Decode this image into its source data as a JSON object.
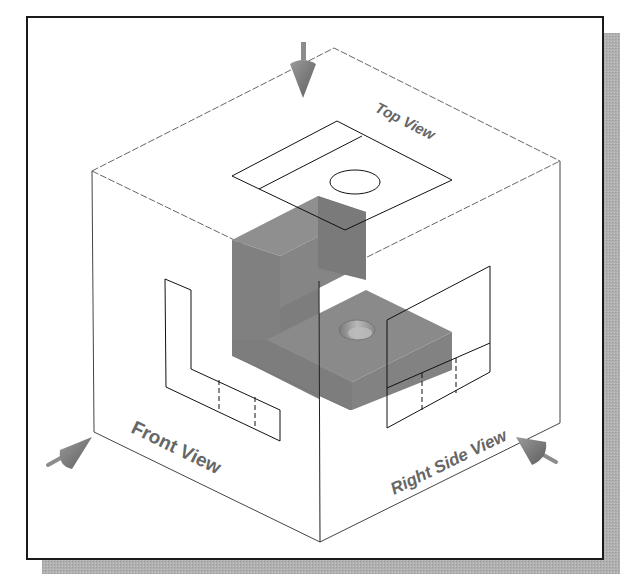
{
  "figure": {
    "type": "orthographic-projection-glass-box",
    "labels": {
      "top_view": "Top View",
      "front_view": "Front View",
      "right_side_view": "Right Side View"
    },
    "colors": {
      "background": "#ffffff",
      "frame_border": "#1a1a1a",
      "shadow": "#aaaaaa",
      "cube_edges": "#555555",
      "projection_lines": "#111111",
      "object_dark": "#7a7a7a",
      "object_mid": "#8c8c8c",
      "object_light": "#9a9a9a",
      "hole": "#b5b5b5",
      "arrow": "#808080",
      "label_text": "#666666"
    },
    "arrows": [
      {
        "name": "top-view-direction",
        "direction": "down"
      },
      {
        "name": "front-view-direction",
        "direction": "up-right"
      },
      {
        "name": "right-side-view-direction",
        "direction": "up-left"
      }
    ]
  }
}
